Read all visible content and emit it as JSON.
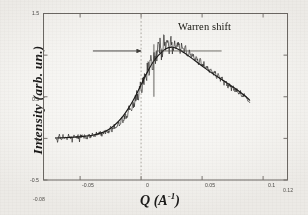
{
  "figure": {
    "background_color": "#f2f1ee",
    "ink_color": "#1b1a19",
    "annotation": "Warren shift"
  },
  "chart_data": {
    "type": "line",
    "title": "",
    "xlabel": "Q (A-1)",
    "xlabel_base": "Q (A",
    "xlabel_exp": "-1",
    "xlabel_close": ")",
    "ylabel": "Intensity (arb. un.)",
    "xlim": [
      -0.08,
      0.12
    ],
    "ylim": [
      -0.5,
      1.5
    ],
    "grid": false,
    "legend": "none",
    "xticks": [
      -0.05,
      0,
      0.05,
      0.1
    ],
    "xtick_labels": [
      "-0.05",
      "0",
      "0.05",
      "0.1"
    ],
    "yticks": [
      -0.5,
      0,
      0.5,
      1,
      1.5
    ],
    "ytick_labels": [
      "-0.5",
      "0",
      "0.5",
      "1",
      "1.5"
    ],
    "x_range_left_label": "-0.08",
    "x_range_right_label": "0.12",
    "series": [
      {
        "name": "measured data",
        "style": "noisy",
        "x": [
          -0.07,
          -0.0685,
          -0.067,
          -0.0655,
          -0.064,
          -0.0625,
          -0.061,
          -0.0595,
          -0.058,
          -0.0565,
          -0.055,
          -0.0535,
          -0.052,
          -0.0505,
          -0.049,
          -0.0475,
          -0.046,
          -0.0445,
          -0.043,
          -0.0415,
          -0.04,
          -0.0385,
          -0.037,
          -0.0355,
          -0.034,
          -0.0325,
          -0.031,
          -0.0295,
          -0.028,
          -0.0265,
          -0.025,
          -0.0235,
          -0.022,
          -0.0205,
          -0.019,
          -0.0175,
          -0.016,
          -0.0145,
          -0.013,
          -0.0115,
          -0.01,
          -0.0085,
          -0.007,
          -0.0055,
          -0.004,
          -0.0025,
          -0.001,
          0.0005,
          0.002,
          0.0035,
          0.005,
          0.0065,
          0.008,
          0.0095,
          0.011,
          0.0125,
          0.014,
          0.0155,
          0.017,
          0.0185,
          0.02,
          0.0215,
          0.023,
          0.0245,
          0.026,
          0.0275,
          0.029,
          0.0305,
          0.032,
          0.0335,
          0.035,
          0.0365,
          0.038,
          0.0395,
          0.041,
          0.0425,
          0.044,
          0.0455,
          0.047,
          0.0485,
          0.05,
          0.0515,
          0.053,
          0.0545,
          0.056,
          0.0575,
          0.059,
          0.0605,
          0.062,
          0.0635,
          0.065,
          0.0665,
          0.068,
          0.0695,
          0.071,
          0.0725,
          0.074,
          0.0755,
          0.077,
          0.0785,
          0.08,
          0.0815,
          0.083,
          0.0845,
          0.086,
          0.0875,
          0.089
        ],
        "y": [
          0.01,
          -0.035,
          0.03,
          -0.02,
          0.045,
          0.005,
          -0.03,
          0.035,
          0.015,
          -0.025,
          0.04,
          0.0,
          0.03,
          -0.015,
          0.05,
          0.01,
          0.035,
          -0.01,
          0.055,
          0.02,
          0.045,
          0.015,
          0.06,
          0.03,
          0.07,
          0.04,
          0.085,
          0.055,
          0.1,
          0.075,
          0.12,
          0.095,
          0.15,
          0.12,
          0.185,
          0.155,
          0.23,
          0.2,
          0.285,
          0.255,
          0.35,
          0.32,
          0.43,
          0.4,
          0.52,
          0.495,
          0.62,
          0.6,
          0.72,
          0.71,
          0.82,
          0.815,
          0.91,
          0.905,
          0.975,
          1.01,
          1.05,
          1.12,
          1.0,
          1.18,
          1.05,
          1.23,
          1.08,
          1.16,
          1.04,
          1.2,
          1.09,
          1.15,
          1.06,
          1.12,
          1.04,
          1.085,
          1.0,
          1.05,
          0.97,
          1.01,
          0.94,
          0.975,
          0.905,
          0.94,
          0.87,
          0.905,
          0.835,
          0.87,
          0.8,
          0.835,
          0.765,
          0.795,
          0.73,
          0.76,
          0.695,
          0.72,
          0.66,
          0.685,
          0.625,
          0.65,
          0.595,
          0.615,
          0.565,
          0.585,
          0.535,
          0.55,
          0.505,
          0.52,
          0.48,
          0.47,
          0.43
        ]
      },
      {
        "name": "fit curve",
        "style": "smooth",
        "x": [
          -0.07,
          -0.064,
          -0.058,
          -0.052,
          -0.046,
          -0.04,
          -0.034,
          -0.028,
          -0.022,
          -0.016,
          -0.01,
          -0.006,
          -0.002,
          0.002,
          0.006,
          0.01,
          0.014,
          0.02,
          0.026,
          0.032,
          0.038,
          0.044,
          0.05,
          0.056,
          0.062,
          0.068,
          0.074,
          0.08,
          0.086,
          0.089
        ],
        "y": [
          0.005,
          0.008,
          0.012,
          0.018,
          0.026,
          0.038,
          0.06,
          0.095,
          0.155,
          0.245,
          0.37,
          0.47,
          0.585,
          0.705,
          0.82,
          0.92,
          0.995,
          1.075,
          1.095,
          1.06,
          1.0,
          0.935,
          0.87,
          0.805,
          0.745,
          0.69,
          0.63,
          0.57,
          0.5,
          0.46
        ]
      }
    ],
    "markers": {
      "zero_line": {
        "x": 0,
        "style": "dashed",
        "label": "Q = 0"
      },
      "peak_line": {
        "x": 0.0105,
        "y_top": 1.13,
        "y_bottom": 0.5,
        "style": "solid"
      },
      "shift_arrow": {
        "from_x": -0.0395,
        "to_x": 0.0,
        "y": 1.05,
        "direction": "right"
      },
      "shift_baseline": {
        "from_x": 0.012,
        "to_x": 0.066,
        "y": 1.05
      }
    }
  }
}
